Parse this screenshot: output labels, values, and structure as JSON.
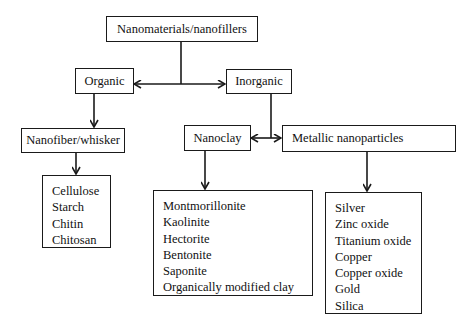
{
  "diagram": {
    "root": {
      "label": "Nanomaterials/nanofillers"
    },
    "categories": [
      {
        "label": "Organic"
      },
      {
        "label": "Inorganic"
      }
    ],
    "subcategories": [
      {
        "label": "Nanofiber/whisker",
        "parent": "Organic"
      },
      {
        "label": "Nanoclay",
        "parent": "Inorganic"
      },
      {
        "label": "Metallic nanoparticles",
        "parent": "Inorganic"
      }
    ],
    "lists": {
      "nanofiber": [
        "Cellulose",
        "Starch",
        "Chitin",
        "Chitosan"
      ],
      "nanoclay": [
        "Montmorillonite",
        "Kaolinite",
        "Hectorite",
        "Bentonite",
        "Saponite",
        "Organically modified clay"
      ],
      "metallic": [
        "Silver",
        "Zinc oxide",
        "Titanium oxide",
        "Copper",
        "Copper oxide",
        "Gold",
        "Silica"
      ]
    },
    "colors": {
      "stroke": "#1a1a1a",
      "background": "#ffffff",
      "text": "#111111"
    }
  }
}
